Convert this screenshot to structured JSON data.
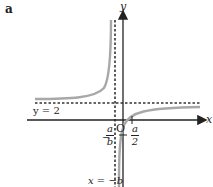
{
  "panel_label": "a",
  "axes": {
    "x_label": "x",
    "y_label": "y",
    "origin_label": "O"
  },
  "asymptotes": {
    "horizontal_label": "y = 2",
    "vertical_label": "x = −b"
  },
  "intercepts": {
    "x_intercept": {
      "sign": "",
      "num": "a",
      "den": "2"
    },
    "y_intercept": {
      "sign": "−",
      "num": "a",
      "den": "b"
    }
  },
  "colors": {
    "curve": "#a8a8a8",
    "axis": "#222222",
    "dash": "#333333"
  }
}
